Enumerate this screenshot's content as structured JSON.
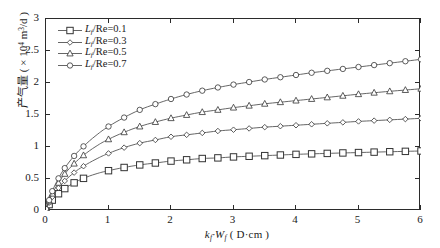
{
  "chart_data": {
    "type": "line",
    "title": "",
    "xlabel": "k_f·W_f ( D·cm )",
    "ylabel": "产气量 ( × 10⁴ m³/d )",
    "xlim": [
      0,
      6
    ],
    "ylim": [
      0,
      3
    ],
    "xticks": [
      "0",
      "1",
      "2",
      "3",
      "4",
      "5",
      "6"
    ],
    "yticks": [
      "0",
      "0.5",
      "1",
      "1.5",
      "2",
      "2.5",
      "3"
    ],
    "grid": false,
    "legend_position": "upper-left",
    "x": [
      0,
      0.05,
      0.1,
      0.2,
      0.3,
      0.45,
      0.6,
      0.8,
      1.0,
      1.25,
      1.5,
      1.75,
      2.0,
      2.25,
      2.5,
      2.75,
      3.0,
      3.25,
      3.5,
      3.75,
      4.0,
      4.25,
      4.5,
      4.75,
      5.0,
      5.25,
      5.5,
      5.75,
      6.0
    ],
    "series": [
      {
        "name": "L_f/Re=0.1",
        "marker": "square",
        "values": [
          0.03,
          0.1,
          0.17,
          0.27,
          0.35,
          0.44,
          0.51,
          0.58,
          0.63,
          0.68,
          0.72,
          0.75,
          0.78,
          0.8,
          0.82,
          0.83,
          0.845,
          0.855,
          0.865,
          0.875,
          0.885,
          0.893,
          0.9,
          0.907,
          0.913,
          0.92,
          0.926,
          0.932,
          0.938
        ]
      },
      {
        "name": "L_f/Re=0.3",
        "marker": "diamond",
        "values": [
          0.03,
          0.13,
          0.22,
          0.36,
          0.47,
          0.6,
          0.7,
          0.81,
          0.9,
          0.99,
          1.06,
          1.11,
          1.16,
          1.19,
          1.22,
          1.25,
          1.27,
          1.29,
          1.31,
          1.325,
          1.34,
          1.355,
          1.37,
          1.385,
          1.4,
          1.412,
          1.424,
          1.436,
          1.448
        ]
      },
      {
        "name": "L_f/Re=0.5",
        "marker": "triangle",
        "values": [
          0.03,
          0.15,
          0.27,
          0.44,
          0.58,
          0.74,
          0.87,
          1.01,
          1.12,
          1.23,
          1.32,
          1.39,
          1.45,
          1.5,
          1.545,
          1.58,
          1.615,
          1.645,
          1.675,
          1.7,
          1.725,
          1.75,
          1.775,
          1.8,
          1.825,
          1.848,
          1.87,
          1.89,
          1.91
        ]
      },
      {
        "name": "L_f/Re=0.7",
        "marker": "circle",
        "values": [
          0.03,
          0.17,
          0.31,
          0.51,
          0.67,
          0.86,
          1.01,
          1.18,
          1.32,
          1.46,
          1.58,
          1.67,
          1.75,
          1.82,
          1.88,
          1.93,
          1.975,
          2.015,
          2.055,
          2.09,
          2.125,
          2.16,
          2.19,
          2.22,
          2.25,
          2.28,
          2.31,
          2.34,
          2.37
        ]
      }
    ]
  },
  "axes": {
    "x_title_base": "k",
    "x_title_sub1": "f",
    "x_title_mid": "·W",
    "x_title_sub2": "f",
    "x_title_units": " ( D·cm )",
    "y_title_cn": "产气量",
    "y_title_units_pre": " ( × 10",
    "y_title_exp": "4",
    "y_title_units_mid": " m",
    "y_title_exp2": "3",
    "y_title_units_post": "/d )"
  },
  "legend": {
    "items": [
      {
        "var": "L",
        "sub": "f",
        "rest": "/Re=0.1",
        "marker": "square"
      },
      {
        "var": "L",
        "sub": "f",
        "rest": "/Re=0.3",
        "marker": "diamond"
      },
      {
        "var": "L",
        "sub": "f",
        "rest": "/Re=0.5",
        "marker": "triangle"
      },
      {
        "var": "L",
        "sub": "f",
        "rest": "/Re=0.7",
        "marker": "circle"
      }
    ]
  },
  "style": {
    "axis_color": "#2b2b2b",
    "line_color": "#555555",
    "marker_stroke": "#333333",
    "marker_fill": "#ffffff",
    "background": "#ffffff"
  }
}
